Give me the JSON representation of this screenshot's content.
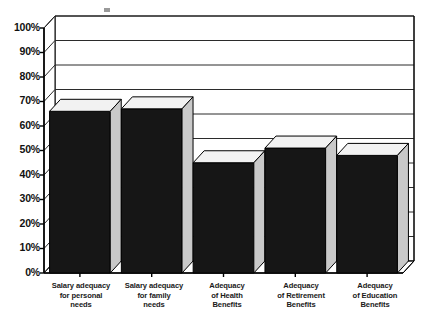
{
  "chart_data": {
    "type": "bar",
    "title": "",
    "subtitle": "",
    "xlabel": "",
    "ylabel": "",
    "categories": [
      "Salary adequacy for personal needs",
      "Salary adequacy for family needs",
      "Adequacy of Health Benefits",
      "Adequacy of Retirement Benefits",
      "Adequacy of Education Benefits"
    ],
    "category_lines": [
      [
        "Salary adequacy",
        "for personal",
        "needs"
      ],
      [
        "Salary adequacy",
        "for family",
        "needs"
      ],
      [
        "Adequacy",
        "of Health",
        "Benefits"
      ],
      [
        "Adequacy",
        "of Retirement",
        "Benefits"
      ],
      [
        "Adequacy",
        "of Education",
        "Benefits"
      ]
    ],
    "values": [
      66,
      67,
      45,
      51,
      48
    ],
    "ylim": [
      0,
      100
    ],
    "ytick_values": [
      0,
      10,
      20,
      30,
      40,
      50,
      60,
      70,
      80,
      90,
      100
    ],
    "ytick_labels": [
      "0%",
      "10%",
      "20%",
      "30%",
      "40%",
      "50%",
      "60%",
      "70%",
      "80%",
      "90%",
      "100%"
    ],
    "grid": true,
    "legend": "none",
    "style": "3d-bar",
    "colors": {
      "bar_front": "#161616",
      "bar_top": "#f2f2f2",
      "bar_side": "#c9c9c9",
      "plot_background": "#ffffff",
      "grid_line": "#2b2b2b",
      "axis_line": "#000000",
      "wall_face": "#ffffff",
      "text": "#111111"
    }
  }
}
